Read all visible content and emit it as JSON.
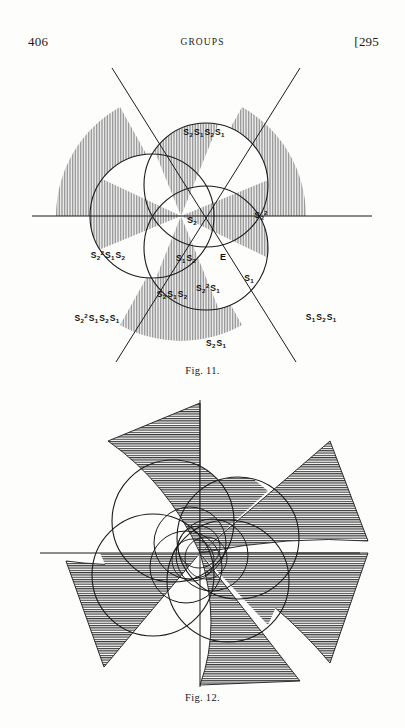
{
  "page": {
    "folio_left": "406",
    "running_title": "GROUPS",
    "folio_right": "[295",
    "background_color": "#fdfdfc",
    "ink_color": "#1a1a1a"
  },
  "figures": [
    {
      "id": "fig-11",
      "caption": "Fig. 11.",
      "description": "Three equal overlapping circles with a horizontal axis and two diagonal lines through the common centre, dividing the plane into twelve labelled regions; alternate regions are shaded with fine vertical hatching.",
      "shading_color": "#b9b9b9",
      "line_color": "#1a1a1a",
      "circles": [
        {
          "name": "circle-upper",
          "cx": 206,
          "cy": 133,
          "r": 62
        },
        {
          "name": "circle-left",
          "cx": 152,
          "cy": 164,
          "r": 62
        },
        {
          "name": "circle-right",
          "cx": 206,
          "cy": 196,
          "r": 62
        }
      ],
      "axes": [
        {
          "name": "horizontal-axis",
          "x1": 32,
          "y1": 164,
          "x2": 372,
          "y2": 164
        },
        {
          "name": "diagonal-axis-1",
          "x1": 116,
          "y1": 18,
          "x2": 296,
          "y2": 310
        },
        {
          "name": "diagonal-axis-2",
          "x1": 296,
          "y1": 18,
          "x2": 116,
          "y2": 310
        }
      ],
      "labels": [
        {
          "name": "label-s2s1s2s1",
          "text_parts": [
            "S",
            "2",
            "S",
            "1",
            "S",
            "2",
            "S",
            "1"
          ],
          "x": 204,
          "y": 80
        },
        {
          "name": "label-s2",
          "text_parts": [
            "S",
            "2"
          ],
          "x": 192,
          "y": 168
        },
        {
          "name": "label-s2-squared",
          "text_parts": [
            "S",
            "2",
            "sq"
          ],
          "x": 260,
          "y": 165
        },
        {
          "name": "label-e",
          "text_parts": [
            "E"
          ],
          "x": 222,
          "y": 206
        },
        {
          "name": "label-s1",
          "text_parts": [
            "S",
            "1"
          ],
          "x": 248,
          "y": 225
        },
        {
          "name": "label-s1s2",
          "text_parts": [
            "S",
            "1",
            "S",
            "2"
          ],
          "x": 186,
          "y": 206
        },
        {
          "name": "label-s2sq-s1s2",
          "text_parts": [
            "S",
            "2",
            "sq",
            "S",
            "1",
            "S",
            "2"
          ],
          "x": 108,
          "y": 203
        },
        {
          "name": "label-s2s1s2",
          "text_parts": [
            "S",
            "2",
            "S",
            "1",
            "S",
            "2"
          ],
          "x": 172,
          "y": 241
        },
        {
          "name": "label-s2sq-s1",
          "text_parts": [
            "S",
            "2",
            "sq",
            "S",
            "1"
          ],
          "x": 206,
          "y": 237
        },
        {
          "name": "label-s2sq-s1s2s1",
          "text_parts": [
            "S",
            "2",
            "sq",
            "S",
            "1",
            "S",
            "2",
            "S",
            "1"
          ],
          "x": 97,
          "y": 266
        },
        {
          "name": "label-s1s2s1",
          "text_parts": [
            "S",
            "1",
            "S",
            "2",
            "S",
            "1"
          ],
          "x": 321,
          "y": 265
        },
        {
          "name": "label-s2s1",
          "text_parts": [
            "S",
            "2",
            "S",
            "1"
          ],
          "x": 216,
          "y": 291
        }
      ],
      "label_texts": {
        "s2s1s2s1": "S2S1S2S1",
        "s2": "S2",
        "s2_squared": "S2²",
        "e": "E",
        "s1": "S1",
        "s1s2": "S1S2",
        "s2sq_s1s2": "S2²S1S2",
        "s2s1s2": "S2S1S2",
        "s2sq_s1": "S2²S1",
        "s2sq_s1s2s1": "S2²S1S2S1",
        "s1s2s1": "S1S2S1",
        "s2s1": "S2S1"
      }
    },
    {
      "id": "fig-12",
      "caption": "Fig. 12.",
      "description": "Pinwheel figure built from four nested families of circles about a common centre with a vertical and a horizontal axis; six curved triangular vanes radiate outward and the alternate regions are filled with fine horizontal hatching.",
      "shading_color": "#5a5a5a",
      "line_color": "#1a1a1a",
      "circles": [
        {
          "name": "fig12-circle-upper-left",
          "cx": 173,
          "cy": 126,
          "r": 61
        },
        {
          "name": "fig12-circle-upper-right",
          "cx": 238,
          "cy": 143,
          "r": 61
        },
        {
          "name": "fig12-circle-lower-left",
          "cx": 153,
          "cy": 180,
          "r": 61
        },
        {
          "name": "fig12-circle-lower-right",
          "cx": 228,
          "cy": 186,
          "r": 61
        },
        {
          "name": "fig12-circle-mid-a",
          "cx": 190,
          "cy": 148,
          "r": 36
        },
        {
          "name": "fig12-circle-mid-b",
          "cx": 210,
          "cy": 160,
          "r": 36
        },
        {
          "name": "fig12-circle-mid-c",
          "cx": 186,
          "cy": 170,
          "r": 36
        },
        {
          "name": "fig12-circle-inner-a",
          "cx": 199,
          "cy": 152,
          "r": 21
        },
        {
          "name": "fig12-circle-inner-b",
          "cx": 205,
          "cy": 162,
          "r": 21
        },
        {
          "name": "fig12-circle-inner-c",
          "cx": 193,
          "cy": 164,
          "r": 21
        }
      ],
      "axes": [
        {
          "name": "fig12-vertical-axis",
          "x1": 200,
          "y1": 5,
          "x2": 200,
          "y2": 292
        },
        {
          "name": "fig12-horizontal-axis",
          "x1": 40,
          "y1": 158,
          "x2": 360,
          "y2": 158
        }
      ]
    }
  ]
}
